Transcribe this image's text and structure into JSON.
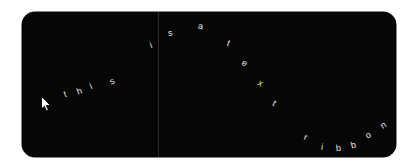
{
  "canvas": {
    "width": 416,
    "height": 168,
    "background_color": "#ffffff"
  },
  "panel": {
    "background_color": "#060606",
    "corner_radius": "13px",
    "left": 22,
    "top": 12,
    "width": 374,
    "height": 145
  },
  "divider": {
    "color": "#2a2a2a",
    "x": 158,
    "orientation": "vertical"
  },
  "ribbon": {
    "full_text": "this is a text ribbon",
    "text_color": "#e8e8e8",
    "font_size": "9px",
    "words": [
      "this",
      "is",
      "a",
      "text",
      "ribbon"
    ],
    "letters": [
      {
        "char": "t",
        "x": 64,
        "y": 90,
        "rotate": -18
      },
      {
        "char": "h",
        "x": 77,
        "y": 87,
        "rotate": -20
      },
      {
        "char": "i",
        "x": 90,
        "y": 82,
        "rotate": -22
      },
      {
        "char": "s",
        "x": 110,
        "y": 77,
        "rotate": -24
      },
      {
        "char": "i",
        "x": 150,
        "y": 41,
        "rotate": -20
      },
      {
        "char": "s",
        "x": 168,
        "y": 29,
        "rotate": -10
      },
      {
        "char": "a",
        "x": 198,
        "y": 22,
        "rotate": 6
      },
      {
        "char": "t",
        "x": 227,
        "y": 39,
        "rotate": 22
      },
      {
        "char": "e",
        "x": 242,
        "y": 59,
        "rotate": 30
      },
      {
        "char": "x",
        "x": 258,
        "y": 79,
        "rotate": 32
      },
      {
        "char": "t",
        "x": 273,
        "y": 99,
        "rotate": 32
      },
      {
        "char": "r",
        "x": 304,
        "y": 133,
        "rotate": 22
      },
      {
        "char": "i",
        "x": 321,
        "y": 143,
        "rotate": 8
      },
      {
        "char": "b",
        "x": 336,
        "y": 144,
        "rotate": -6
      },
      {
        "char": "b",
        "x": 351,
        "y": 141,
        "rotate": -16
      },
      {
        "char": "o",
        "x": 366,
        "y": 131,
        "rotate": -26
      },
      {
        "char": "n",
        "x": 381,
        "y": 121,
        "rotate": -32
      }
    ]
  },
  "cursor": {
    "x": 41,
    "y": 96,
    "fill_color": "#ffffff",
    "outline_color": "#000000",
    "label": "mouse-pointer"
  }
}
